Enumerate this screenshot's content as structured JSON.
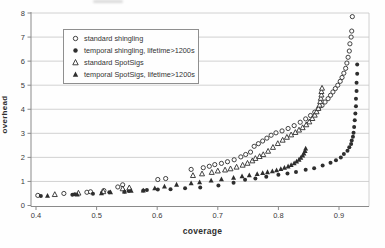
{
  "chart_data": {
    "type": "scatter",
    "title": "",
    "xlabel": "coverage",
    "ylabel": "overhead",
    "xlim": [
      0.4,
      0.948
    ],
    "ylim": [
      0,
      8
    ],
    "x_ticks": [
      0.4,
      0.5,
      0.6,
      0.7,
      0.8,
      0.9
    ],
    "y_ticks": [
      0,
      1,
      2,
      3,
      4,
      5,
      6,
      7,
      8
    ],
    "grid": "horizontal-only",
    "legend_position": "top-left-inside",
    "colors": {
      "marker": "#2e2e2e",
      "grid": "#c6c6c6",
      "axis": "#8a8a8a",
      "text": "#3a3a3a",
      "background": "#fefefe"
    },
    "series": [
      {
        "name": "standard shingling",
        "marker": "open-circle",
        "points": [
          [
            0.403,
            0.42
          ],
          [
            0.446,
            0.5
          ],
          [
            0.484,
            0.55
          ],
          [
            0.49,
            0.57
          ],
          [
            0.512,
            0.62
          ],
          [
            0.535,
            0.77
          ],
          [
            0.543,
            0.86
          ],
          [
            0.601,
            1.08
          ],
          [
            0.614,
            1.12
          ],
          [
            0.656,
            1.5
          ],
          [
            0.676,
            1.57
          ],
          [
            0.686,
            1.63
          ],
          [
            0.695,
            1.7
          ],
          [
            0.706,
            1.75
          ],
          [
            0.716,
            1.82
          ],
          [
            0.727,
            1.9
          ],
          [
            0.738,
            2.02
          ],
          [
            0.746,
            2.12
          ],
          [
            0.754,
            2.22
          ],
          [
            0.76,
            2.46
          ],
          [
            0.767,
            2.57
          ],
          [
            0.774,
            2.68
          ],
          [
            0.781,
            2.8
          ],
          [
            0.788,
            2.92
          ],
          [
            0.796,
            3.02
          ],
          [
            0.806,
            3.1
          ],
          [
            0.816,
            3.2
          ],
          [
            0.826,
            3.32
          ],
          [
            0.836,
            3.46
          ],
          [
            0.845,
            3.6
          ],
          [
            0.853,
            3.74
          ],
          [
            0.86,
            3.88
          ],
          [
            0.866,
            4.02
          ],
          [
            0.872,
            4.16
          ],
          [
            0.877,
            4.3
          ],
          [
            0.882,
            4.44
          ],
          [
            0.886,
            4.58
          ],
          [
            0.89,
            4.72
          ],
          [
            0.894,
            4.86
          ],
          [
            0.898,
            5.0
          ],
          [
            0.902,
            5.16
          ],
          [
            0.905,
            5.32
          ],
          [
            0.908,
            5.5
          ],
          [
            0.911,
            5.7
          ],
          [
            0.913,
            5.92
          ],
          [
            0.915,
            6.16
          ],
          [
            0.917,
            6.42
          ],
          [
            0.918,
            6.72
          ],
          [
            0.92,
            7.0
          ],
          [
            0.921,
            7.25
          ],
          [
            0.922,
            7.85
          ]
        ]
      },
      {
        "name": "temporal shingling, lifetime>1200s",
        "marker": "filled-circle",
        "points": [
          [
            0.408,
            0.4
          ],
          [
            0.46,
            0.45
          ],
          [
            0.464,
            0.47
          ],
          [
            0.494,
            0.49
          ],
          [
            0.509,
            0.53
          ],
          [
            0.521,
            0.55
          ],
          [
            0.546,
            0.57
          ],
          [
            0.553,
            0.6
          ],
          [
            0.577,
            0.62
          ],
          [
            0.583,
            0.64
          ],
          [
            0.601,
            0.66
          ],
          [
            0.622,
            0.68
          ],
          [
            0.646,
            0.72
          ],
          [
            0.671,
            0.75
          ],
          [
            0.701,
            0.83
          ],
          [
            0.726,
            0.95
          ],
          [
            0.745,
            1.07
          ],
          [
            0.762,
            1.12
          ],
          [
            0.78,
            1.2
          ],
          [
            0.8,
            1.28
          ],
          [
            0.815,
            1.33
          ],
          [
            0.829,
            1.39
          ],
          [
            0.845,
            1.49
          ],
          [
            0.859,
            1.55
          ],
          [
            0.873,
            1.66
          ],
          [
            0.886,
            1.78
          ],
          [
            0.895,
            1.88
          ],
          [
            0.903,
            2.0
          ],
          [
            0.908,
            2.14
          ],
          [
            0.914,
            2.28
          ],
          [
            0.917,
            2.42
          ],
          [
            0.92,
            2.56
          ],
          [
            0.921,
            2.7
          ],
          [
            0.923,
            2.86
          ],
          [
            0.924,
            3.02
          ],
          [
            0.925,
            3.26
          ],
          [
            0.926,
            3.54
          ],
          [
            0.927,
            3.82
          ],
          [
            0.928,
            4.12
          ],
          [
            0.928,
            4.44
          ],
          [
            0.929,
            4.76
          ],
          [
            0.929,
            5.1
          ],
          [
            0.93,
            5.48
          ],
          [
            0.93,
            5.86
          ]
        ]
      },
      {
        "name": "standard SpotSigs",
        "marker": "open-triangle",
        "points": [
          [
            0.431,
            0.46
          ],
          [
            0.47,
            0.52
          ],
          [
            0.511,
            0.58
          ],
          [
            0.543,
            0.7
          ],
          [
            0.554,
            0.74
          ],
          [
            0.659,
            1.25
          ],
          [
            0.674,
            1.32
          ],
          [
            0.69,
            1.38
          ],
          [
            0.7,
            1.44
          ],
          [
            0.712,
            1.48
          ],
          [
            0.721,
            1.53
          ],
          [
            0.731,
            1.6
          ],
          [
            0.741,
            1.68
          ],
          [
            0.749,
            1.76
          ],
          [
            0.757,
            1.86
          ],
          [
            0.762,
            1.96
          ],
          [
            0.769,
            2.04
          ],
          [
            0.775,
            2.12
          ],
          [
            0.783,
            2.26
          ],
          [
            0.791,
            2.42
          ],
          [
            0.799,
            2.58
          ],
          [
            0.807,
            2.72
          ],
          [
            0.814,
            2.84
          ],
          [
            0.821,
            2.94
          ],
          [
            0.828,
            3.04
          ],
          [
            0.834,
            3.14
          ],
          [
            0.84,
            3.24
          ],
          [
            0.846,
            3.36
          ],
          [
            0.851,
            3.48
          ],
          [
            0.856,
            3.62
          ],
          [
            0.86,
            3.76
          ],
          [
            0.863,
            3.9
          ],
          [
            0.866,
            4.04
          ],
          [
            0.868,
            4.18
          ],
          [
            0.869,
            4.32
          ],
          [
            0.87,
            4.46
          ],
          [
            0.871,
            4.6
          ],
          [
            0.871,
            4.74
          ],
          [
            0.872,
            4.88
          ]
        ]
      },
      {
        "name": "temporal SpotSigs, lifetime>1200s",
        "marker": "filled-triangle",
        "points": [
          [
            0.419,
            0.41
          ],
          [
            0.468,
            0.46
          ],
          [
            0.508,
            0.51
          ],
          [
            0.523,
            0.55
          ],
          [
            0.546,
            0.59
          ],
          [
            0.557,
            0.62
          ],
          [
            0.577,
            0.63
          ],
          [
            0.596,
            0.72
          ],
          [
            0.612,
            0.79
          ],
          [
            0.632,
            0.87
          ],
          [
            0.656,
            0.93
          ],
          [
            0.67,
            0.97
          ],
          [
            0.689,
            1.04
          ],
          [
            0.706,
            1.09
          ],
          [
            0.726,
            1.16
          ],
          [
            0.74,
            1.22
          ],
          [
            0.752,
            1.26
          ],
          [
            0.765,
            1.31
          ],
          [
            0.774,
            1.35
          ],
          [
            0.782,
            1.39
          ],
          [
            0.79,
            1.43
          ],
          [
            0.797,
            1.47
          ],
          [
            0.804,
            1.52
          ],
          [
            0.81,
            1.57
          ],
          [
            0.816,
            1.63
          ],
          [
            0.821,
            1.69
          ],
          [
            0.826,
            1.76
          ],
          [
            0.83,
            1.83
          ],
          [
            0.834,
            1.91
          ],
          [
            0.837,
            1.99
          ],
          [
            0.84,
            2.08
          ],
          [
            0.842,
            2.17
          ],
          [
            0.844,
            2.27
          ],
          [
            0.845,
            2.37
          ]
        ]
      }
    ]
  }
}
